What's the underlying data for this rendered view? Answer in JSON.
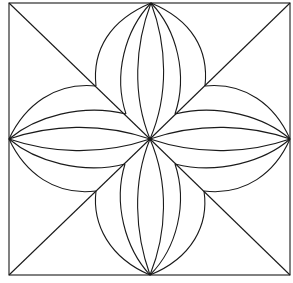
{
  "diagram": {
    "title": "",
    "colors": {
      "stroke": "#1a1a1a",
      "background": "#ffffff"
    },
    "square": {
      "x1": 9,
      "y1": 3,
      "x2": 290,
      "y2": 275
    },
    "center": [
      150,
      139
    ],
    "apexes": {
      "top": [
        151,
        3
      ],
      "right": [
        290,
        139
      ],
      "bottom": [
        150,
        275
      ],
      "left": [
        9,
        139
      ]
    },
    "inner_corners": {
      "top_left": [
        96,
        86
      ],
      "top_right": [
        205,
        86
      ],
      "bottom_right": [
        204,
        191
      ],
      "bottom_left": [
        96,
        191
      ]
    },
    "mid_points": {
      "top_left": [
        126,
        114
      ],
      "top_right": [
        175,
        114
      ],
      "bottom_right": [
        175,
        164
      ],
      "bottom_left": [
        125,
        164
      ]
    }
  }
}
